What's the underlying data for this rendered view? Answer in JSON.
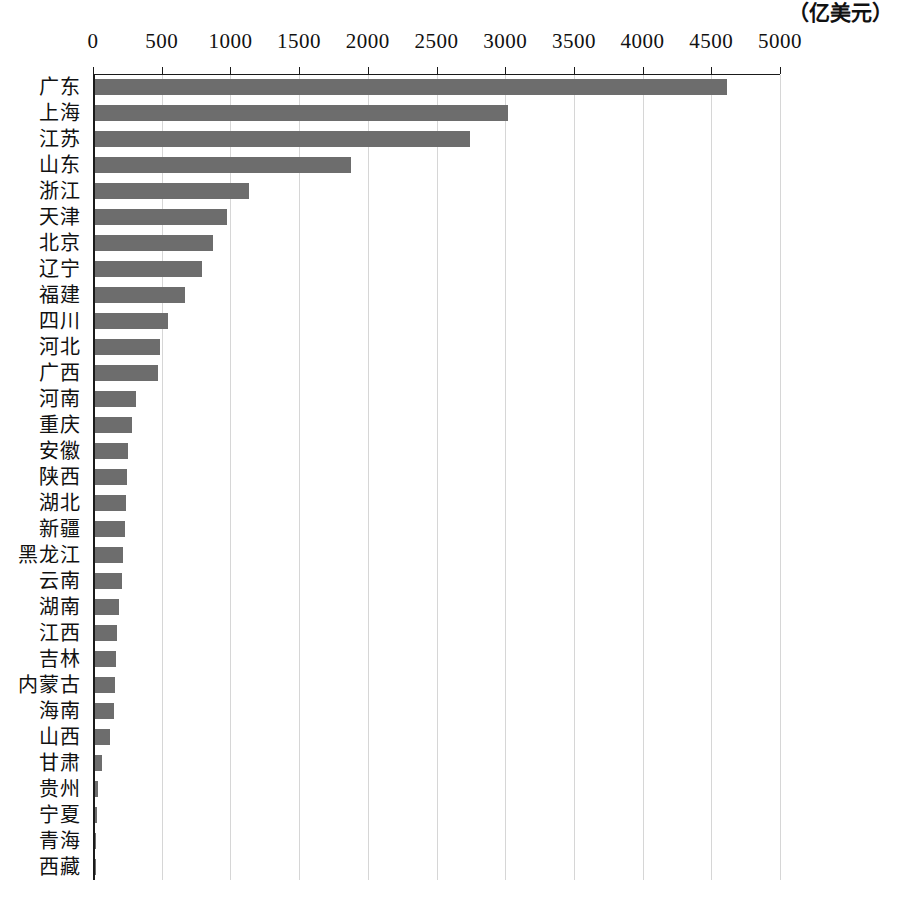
{
  "chart_data": {
    "type": "bar",
    "orientation": "horizontal",
    "title": "",
    "subtitle": "",
    "xlabel": "",
    "ylabel": "",
    "unit_label": "（亿美元）",
    "xlim": [
      0,
      5000
    ],
    "xticks": [
      0,
      500,
      1000,
      1500,
      2000,
      2500,
      3000,
      3500,
      4000,
      4500,
      5000
    ],
    "xtick_labels": [
      "0",
      "500",
      "1000",
      "1500",
      "2000",
      "2500",
      "3000",
      "3500",
      "4000",
      "4500",
      "5000"
    ],
    "grid": true,
    "grid_axis": "x",
    "legend": false,
    "legend_position": "none",
    "bar_color": "#6d6d6d",
    "axis_color": "#1a1a1a",
    "grid_color": "#d6d6d6",
    "categories": [
      "广东",
      "上海",
      "江苏",
      "山东",
      "浙江",
      "天津",
      "北京",
      "辽宁",
      "福建",
      "四川",
      "河北",
      "广西",
      "河南",
      "重庆",
      "安徽",
      "陕西",
      "湖北",
      "新疆",
      "黑龙江",
      "云南",
      "湖南",
      "江西",
      "吉林",
      "内蒙古",
      "海南",
      "山西",
      "甘肃",
      "贵州",
      "宁夏",
      "青海",
      "西藏"
    ],
    "values": [
      4600,
      3005,
      2730,
      1860,
      1120,
      960,
      860,
      780,
      655,
      530,
      475,
      460,
      295,
      268,
      242,
      235,
      228,
      218,
      205,
      196,
      176,
      162,
      153,
      146,
      138,
      110,
      48,
      22,
      16,
      10,
      6
    ]
  }
}
